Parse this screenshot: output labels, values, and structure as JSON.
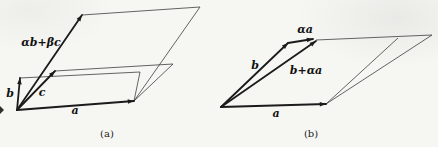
{
  "page": {
    "width": 438,
    "height": 147,
    "background": "#f6f6f3",
    "ink": "#1b1b1b",
    "thin_ink": "#3d3d3d",
    "label_ink": "#111111",
    "caption_ink": "#222222"
  },
  "figure": {
    "panels": [
      {
        "id": "a",
        "caption": "(a)",
        "caption_pos": {
          "x": 107,
          "y": 137
        },
        "origin": {
          "x": 17,
          "y": 110
        },
        "vectors": [
          {
            "name": "vector-a",
            "label": "a",
            "to": {
              "x": 134,
              "y": 101
            },
            "label_pos": {
              "x": 75,
              "y": 114
            }
          },
          {
            "name": "vector-b",
            "label": "b",
            "to": {
              "x": 20,
              "y": 78
            },
            "label_pos": {
              "x": 10,
              "y": 97
            }
          },
          {
            "name": "vector-c",
            "label": "c",
            "to": {
              "x": 55,
              "y": 71
            },
            "label_pos": {
              "x": 42,
              "y": 96
            }
          },
          {
            "name": "vector-alpha-b-plus-beta-c",
            "label": "αb+βc",
            "to": {
              "x": 82,
              "y": 15
            },
            "label_pos": {
              "x": 41,
              "y": 46
            }
          }
        ],
        "outlines": [
          {
            "name": "parallelogram-a-b-edge",
            "points": [
              [
                20,
                78
              ],
              [
                140,
                72
              ],
              [
                134,
                101
              ]
            ]
          },
          {
            "name": "parallelogram-a-c-edge",
            "points": [
              [
                55,
                71
              ],
              [
                173,
                64
              ],
              [
                134,
                101
              ]
            ]
          },
          {
            "name": "parallelogram-a-combination-edge",
            "points": [
              [
                82,
                15
              ],
              [
                200,
                7
              ],
              [
                134,
                101
              ]
            ]
          }
        ]
      },
      {
        "id": "b",
        "caption": "(b)",
        "caption_pos": {
          "x": 311,
          "y": 137
        },
        "origin": {
          "x": 221,
          "y": 107
        },
        "vectors": [
          {
            "name": "vector-a",
            "label": "a",
            "to": {
              "x": 326,
              "y": 104
            },
            "label_pos": {
              "x": 276,
              "y": 117
            }
          },
          {
            "name": "vector-b",
            "label": "b",
            "to": {
              "x": 288,
              "y": 43
            },
            "label_pos": {
              "x": 255,
              "y": 69
            }
          },
          {
            "name": "vector-b-plus-alpha-a",
            "label": "b+αa",
            "to": {
              "x": 316,
              "y": 41
            },
            "label_pos": {
              "x": 306,
              "y": 74
            }
          },
          {
            "name": "vector-alpha-a",
            "label": "αa",
            "from": {
              "x": 288,
              "y": 43
            },
            "to": {
              "x": 313,
              "y": 39
            },
            "label_pos": {
              "x": 305,
              "y": 33
            }
          }
        ],
        "outlines": [
          {
            "name": "parallelogram-b-top-edge",
            "points": [
              [
                316,
                40
              ],
              [
                432,
                35
              ]
            ]
          },
          {
            "name": "parallelogram-b-inner-right-edge",
            "points": [
              [
                398,
                38
              ],
              [
                326,
                104
              ]
            ]
          },
          {
            "name": "parallelogram-b-outer-right-edge",
            "points": [
              [
                432,
                35
              ],
              [
                326,
                104
              ]
            ]
          }
        ]
      }
    ],
    "artifacts": [
      {
        "name": "left-edge-speck",
        "points": [
          [
            0,
            106
          ],
          [
            4,
            110
          ],
          [
            0,
            114
          ]
        ]
      }
    ]
  }
}
